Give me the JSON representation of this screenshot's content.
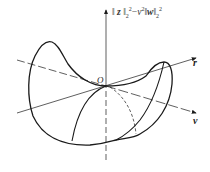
{
  "figure": {
    "axis_label_vertical": {
      "norm_open": "‖",
      "var_z": "z",
      "norm_close_1": "‖",
      "sub1": "2",
      "sup1": "2",
      "minus": "−",
      "nu": "ν",
      "nu_sup": "2",
      "norm_open_2": "‖",
      "var_w": "w",
      "norm_close_2": "‖",
      "sub2": "2",
      "sup2": "2"
    },
    "origin_label": "O",
    "axis_label_r": "r",
    "axis_label_v": "v",
    "colors": {
      "stroke": "#1a1a1a",
      "background": "#ffffff"
    }
  }
}
